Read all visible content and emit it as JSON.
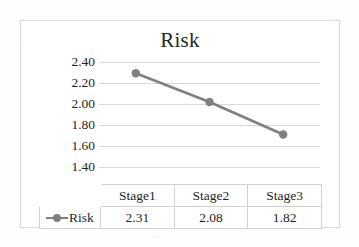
{
  "chart_data": {
    "type": "line",
    "title": "Risk",
    "xlabel": "",
    "ylabel": "",
    "categories": [
      "Stage1",
      "Stage2",
      "Stage3"
    ],
    "series": [
      {
        "name": "Risk",
        "values": [
          2.31,
          2.08,
          1.82
        ],
        "value_labels": [
          "2.31",
          "2.08",
          "1.82"
        ],
        "color": "#808080",
        "marker": "circle"
      }
    ],
    "ylim": [
      1.4,
      2.4
    ],
    "ytick_labels": [
      "2.40",
      "2.20",
      "2.00",
      "1.80",
      "1.60",
      "1.40"
    ],
    "ytick_values": [
      2.4,
      2.2,
      2.0,
      1.8,
      1.6,
      1.4
    ],
    "grid": true,
    "legend_position": "data-table-left",
    "has_data_table": true
  },
  "table": {
    "header_row": [
      "",
      "Stage1",
      "Stage2",
      "Stage3"
    ],
    "value_row_label": "Risk",
    "values": [
      "2.31",
      "2.08",
      "1.82"
    ]
  },
  "colors": {
    "series": "#808080",
    "gridline": "#d9d9d9",
    "frame_border": "#dcdcdc",
    "table_border": "#d2d2d2",
    "text": "#1f1f1f",
    "background": "#ffffff"
  }
}
